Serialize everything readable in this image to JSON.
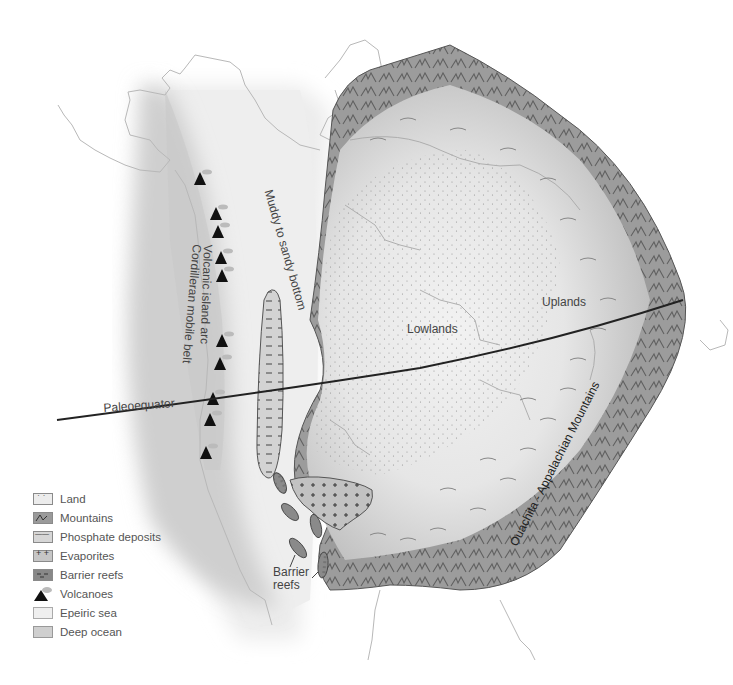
{
  "map": {
    "labels": {
      "muddy": "Muddy   to   sandy   bottom",
      "volcanic_arc": "Volcanic island arc",
      "cordilleran": "Cordilleran mobile belt",
      "lowlands": "Lowlands",
      "uplands": "Uplands",
      "paleoequator": "Paleoequator",
      "barrier_reefs_1": "Barrier",
      "barrier_reefs_2": "reefs",
      "ouachita": "Ouachita - Appalachian Mountains"
    },
    "colors": {
      "land": "#ececec",
      "mountains": "#9a9a9a",
      "epeiric_sea": "#efefef",
      "deep_ocean": "#cfcfcf",
      "coastline": "#b5b5b5",
      "equator_line": "#222222"
    }
  },
  "legend": {
    "items": [
      {
        "icon": "land-swatch",
        "label": "Land"
      },
      {
        "icon": "mountains-swatch",
        "label": "Mountains"
      },
      {
        "icon": "phosphate-swatch",
        "label": "Phosphate deposits"
      },
      {
        "icon": "evaporites-swatch",
        "label": "Evaporites"
      },
      {
        "icon": "barrier-reefs-swatch",
        "label": "Barrier reefs"
      },
      {
        "icon": "volcano-icon",
        "label": "Volcanoes"
      },
      {
        "icon": "epeiric-sea-swatch",
        "label": "Epeiric sea"
      },
      {
        "icon": "deep-ocean-swatch",
        "label": "Deep ocean"
      }
    ]
  }
}
